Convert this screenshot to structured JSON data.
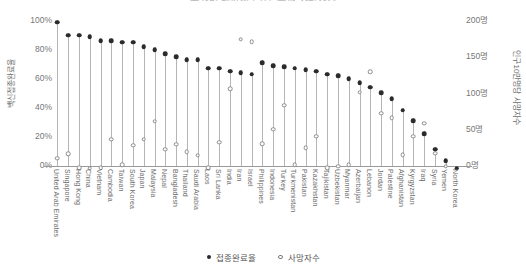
{
  "chart_data": {
    "type": "scatter",
    "title": "국가별 백신접종완료율과 사망자수",
    "xlabel": "",
    "ylabel": "백신접종완료율",
    "y2label": "인구10만명당 사망자수",
    "ylim": [
      0,
      105
    ],
    "y2lim": [
      0,
      210
    ],
    "grid": false,
    "legend_position": "bottom",
    "yticks": [
      "0%",
      "20%",
      "40%",
      "60%",
      "80%",
      "100%"
    ],
    "ytick_values": [
      0,
      20,
      40,
      60,
      80,
      100
    ],
    "y2ticks": [
      "0명",
      "50명",
      "100명",
      "150명",
      "200명"
    ],
    "y2tick_values": [
      0,
      50,
      100,
      150,
      200
    ],
    "categories": [
      "United Arab Emirates",
      "Singapore",
      "Hong Kong",
      "China",
      "Vietnam",
      "Cambodia",
      "Taiwan",
      "South Korea",
      "Japan",
      "Malaysia",
      "Nepal",
      "Bangladesh",
      "Thailand",
      "Saudi Arabia",
      "Laos",
      "Sri Lanka",
      "India",
      "Iran",
      "Israel",
      "Philippines",
      "Indonesia",
      "Turkey",
      "Turkmenistan",
      "Pakistan",
      "Kazakhstan",
      "Tajikistan",
      "Uzbekistan",
      "Myanmar",
      "Azerbaijan",
      "Lebanon",
      "Jordan",
      "Palestine",
      "Afghanistan",
      "Kyrgyzstan",
      "Iraq",
      "Syria",
      "Yemen",
      "North Korea"
    ],
    "series": [
      {
        "name": "접종완료율",
        "marker": "filled-circle",
        "axis": "left",
        "unit": "%",
        "values": [
          101,
          92,
          92,
          91,
          88,
          88,
          87,
          87,
          84,
          82,
          79,
          77,
          75,
          75,
          69,
          69,
          67,
          66,
          65,
          73,
          71,
          70,
          69,
          68,
          67,
          65,
          64,
          62,
          59,
          56,
          52,
          48,
          40,
          33,
          24,
          13,
          5,
          0
        ]
      },
      {
        "name": "사망자수",
        "marker": "open-circle",
        "axis": "right",
        "unit": "명",
        "values": [
          14,
          20,
          1,
          0,
          1,
          40,
          5,
          32,
          40,
          65,
          26,
          33,
          23,
          18,
          1,
          36,
          110,
          178,
          175,
          34,
          54,
          87,
          5,
          28,
          44,
          1,
          3,
          5,
          105,
          133,
          76,
          70,
          19,
          44,
          62,
          21,
          3,
          0
        ]
      }
    ]
  }
}
